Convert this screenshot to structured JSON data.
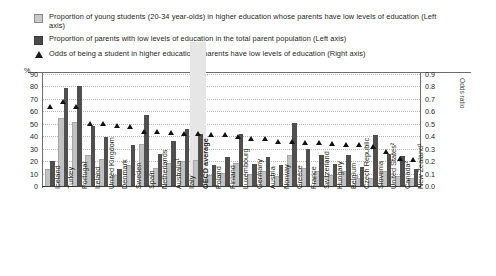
{
  "legend": [
    {
      "marker": "square-light-icon",
      "text": "Proportion of young students (20-34 year-olds) in higher education whose parents have low levels of education (Left axis)"
    },
    {
      "marker": "square-dark-icon",
      "text": "Proportion of parents with low levels of education in the total parent population (Left axis)"
    },
    {
      "marker": "triangle-icon",
      "text": "Odds of being a student in higher education if parents have low levels of education (Right axis)"
    }
  ],
  "axes": {
    "left_unit": "%",
    "left_ticks": [
      "0",
      "10",
      "20",
      "30",
      "40",
      "50",
      "60",
      "70",
      "80",
      "90"
    ],
    "right_ticks": [
      "0.0",
      "0.1",
      "0.2",
      "0.3",
      "0.4",
      "0.5",
      "0.6",
      "0.7",
      "0.8",
      "0.9"
    ],
    "right_title": "Odds ratio"
  },
  "highlight": "OECD average",
  "chart_data": {
    "type": "bar",
    "title": "",
    "xlabel": "",
    "ylabel": "%",
    "ylim": [
      0,
      90
    ],
    "y2lim": [
      0.0,
      0.9
    ],
    "y2label": "Odds ratio",
    "grid": true,
    "legend_position": "top",
    "categories": [
      "Iceland",
      "Turkey",
      "Portugal",
      "Ireland",
      "United Kingdom",
      "Denmark",
      "Sweden",
      "Spain",
      "Netherlands",
      "Australia¹",
      "Italy",
      "OECD average",
      "Poland",
      "Finland",
      "Luxembourg",
      "Germany",
      "Austria",
      "Norway",
      "Greece",
      "France",
      "Switzerland",
      "Hungary",
      "Belgium",
      "Czech Republic",
      "Slovenia",
      "United States²",
      "Canada²",
      "New Zealand¹"
    ],
    "series": [
      {
        "name": "Proportion of young students (20-34 year-olds) in higher education whose parents have low levels of education (Left axis)",
        "axis": "left",
        "color": "#c2c2c2",
        "values": [
          13,
          54,
          51,
          24,
          21,
          8,
          16,
          33,
          14,
          18,
          19,
          20,
          8,
          10,
          18,
          9,
          11,
          7,
          24,
          14,
          11,
          8,
          11,
          6,
          6,
          11,
          7,
          6
        ]
      },
      {
        "name": "Proportion of parents with low levels of education in the total parent population (Left axis)",
        "axis": "left",
        "color": "#4f4f4f",
        "values": [
          20,
          79,
          80,
          48,
          39,
          14,
          33,
          57,
          26,
          36,
          46,
          42,
          17,
          23,
          42,
          18,
          23,
          17,
          51,
          30,
          25,
          18,
          25,
          15,
          41,
          26,
          24,
          14
        ]
      },
      {
        "name": "Odds of being a student in higher education if parents have low levels of education (Right axis)",
        "axis": "right",
        "color": "#111111",
        "values": [
          0.64,
          0.68,
          0.64,
          0.5,
          0.5,
          0.49,
          0.48,
          0.44,
          0.44,
          0.43,
          0.42,
          0.42,
          0.41,
          0.41,
          0.4,
          0.38,
          0.38,
          0.36,
          0.36,
          0.35,
          0.35,
          0.34,
          0.33,
          0.33,
          0.32,
          0.28,
          0.22,
          0.21
        ]
      }
    ]
  }
}
